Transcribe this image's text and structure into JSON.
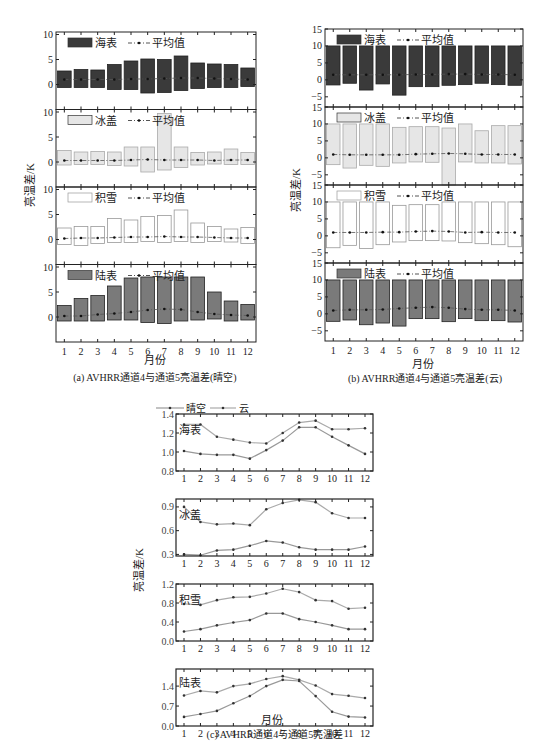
{
  "chart_data": [
    {
      "id": "a",
      "type": "bar",
      "title": "(a) AVHRR通道4与通道5亮温差(晴空)",
      "xlabel": "月份",
      "ylabel": "亮温差/K",
      "categories": [
        "1",
        "2",
        "3",
        "4",
        "5",
        "6",
        "7",
        "8",
        "9",
        "10",
        "11",
        "12"
      ],
      "ylim": [
        -5,
        10.5
      ],
      "yticks": [
        0,
        5,
        10
      ],
      "panels": [
        {
          "name": "海表",
          "legend": [
            "海表",
            "平均值"
          ],
          "fill": "#3a3a3a",
          "min": [
            -0.6,
            -0.6,
            -0.6,
            -1.0,
            -1.0,
            -1.7,
            -1.6,
            -1.2,
            -0.8,
            -0.6,
            -0.6,
            -0.4
          ],
          "max": [
            2.7,
            3.0,
            2.9,
            4.0,
            4.7,
            5.1,
            5.0,
            5.7,
            4.3,
            4.1,
            4.0,
            3.3
          ],
          "mean": [
            1.0,
            1.0,
            1.0,
            1.0,
            1.1,
            1.1,
            1.2,
            1.3,
            1.3,
            1.2,
            1.1,
            1.0
          ]
        },
        {
          "name": "冰盖",
          "legend": [
            "冰盖",
            "平均值"
          ],
          "fill": "#e6e6e6",
          "min": [
            -0.6,
            -0.5,
            -0.5,
            -0.7,
            -0.8,
            -2.0,
            -1.6,
            -1.1,
            -0.6,
            -0.4,
            -0.5,
            -0.5
          ],
          "max": [
            2.3,
            2.0,
            2.1,
            2.0,
            3.0,
            3.0,
            9.7,
            3.0,
            1.9,
            2.0,
            2.6,
            1.9
          ],
          "mean": [
            0.3,
            0.3,
            0.3,
            0.3,
            0.4,
            0.5,
            0.4,
            0.4,
            0.4,
            0.3,
            0.4,
            0.4
          ]
        },
        {
          "name": "积雪",
          "legend": [
            "积雪",
            "平均值"
          ],
          "fill": "#ffffff",
          "min": [
            -1.0,
            -1.2,
            -0.8,
            -0.6,
            -0.6,
            -0.4,
            -0.6,
            -0.4,
            -0.6,
            -0.4,
            -0.5,
            -0.8
          ],
          "max": [
            2.3,
            2.6,
            2.6,
            4.2,
            3.9,
            4.6,
            4.8,
            5.9,
            3.3,
            2.6,
            2.1,
            2.4
          ],
          "mean": [
            0.2,
            0.3,
            0.3,
            0.4,
            0.5,
            0.5,
            0.6,
            0.5,
            0.5,
            0.4,
            0.3,
            0.3
          ]
        },
        {
          "name": "陆表",
          "legend": [
            "陆表",
            "平均值"
          ],
          "fill": "#7a7a7a",
          "min": [
            -0.8,
            -0.8,
            -0.8,
            -0.6,
            -0.6,
            -1.1,
            -1.3,
            -0.8,
            -0.6,
            -0.4,
            -0.8,
            -0.6
          ],
          "max": [
            2.3,
            3.7,
            4.3,
            6.2,
            7.8,
            8.0,
            8.0,
            8.0,
            8.0,
            5.0,
            3.2,
            2.5
          ],
          "mean": [
            0.2,
            0.2,
            0.5,
            0.7,
            1.0,
            1.4,
            1.6,
            1.5,
            1.0,
            0.6,
            0.4,
            0.3
          ]
        }
      ]
    },
    {
      "id": "b",
      "type": "bar",
      "title": "(b) AVHRR通道4与通道5亮温差(云)",
      "xlabel": "月份",
      "ylabel": "亮温差/K",
      "categories": [
        "1",
        "2",
        "3",
        "4",
        "5",
        "6",
        "7",
        "8",
        "9",
        "10",
        "11",
        "12"
      ],
      "ylim": [
        -8,
        15
      ],
      "yticks": [
        -5,
        0,
        5,
        10,
        15
      ],
      "panels": [
        {
          "name": "海表",
          "legend": [
            "海表",
            "平均值"
          ],
          "fill": "#3a3a3a",
          "min": [
            -1.5,
            -1.0,
            -3.0,
            -1.2,
            -4.5,
            -2.0,
            -2.0,
            -1.6,
            -1.4,
            -1.0,
            -1.4,
            -1.6
          ],
          "max": [
            10,
            10,
            10,
            10,
            10,
            10,
            10,
            10,
            10,
            10,
            10,
            10
          ],
          "mean": [
            1.5,
            1.5,
            1.5,
            1.5,
            1.5,
            1.6,
            1.6,
            1.7,
            1.7,
            1.6,
            1.6,
            1.5
          ]
        },
        {
          "name": "冰盖",
          "legend": [
            "冰盖",
            "平均值"
          ],
          "fill": "#e6e6e6",
          "min": [
            -2.0,
            -3.0,
            -2.2,
            -2.5,
            -1.5,
            -1.2,
            -1.3,
            -15.0,
            -1.2,
            -1.5,
            -1.5,
            -1.8
          ],
          "max": [
            10,
            10,
            10,
            10,
            9.0,
            9.2,
            9.2,
            8.8,
            10,
            8.0,
            9.5,
            9.5
          ],
          "mean": [
            1.0,
            0.9,
            0.9,
            0.9,
            0.9,
            1.1,
            1.2,
            1.3,
            1.2,
            1.0,
            1.0,
            1.0
          ]
        },
        {
          "name": "积雪",
          "legend": [
            "积雪",
            "平均值"
          ],
          "fill": "#ffffff",
          "min": [
            -3.5,
            -2.8,
            -3.7,
            -2.6,
            -1.8,
            -1.4,
            -1.4,
            -1.5,
            -2.0,
            -2.3,
            -2.6,
            -3.2
          ],
          "max": [
            10,
            10,
            10,
            10,
            9.0,
            9.2,
            9.2,
            10,
            10,
            10,
            10,
            10
          ],
          "mean": [
            1.0,
            1.0,
            1.0,
            1.1,
            1.1,
            1.3,
            1.4,
            1.3,
            1.0,
            1.1,
            1.0,
            1.0
          ]
        },
        {
          "name": "陆表",
          "legend": [
            "陆表",
            "平均值"
          ],
          "fill": "#7a7a7a",
          "min": [
            -2.2,
            -1.8,
            -3.2,
            -2.7,
            -3.6,
            -1.4,
            -1.4,
            -2.3,
            -1.4,
            -2.0,
            -2.0,
            -2.4
          ],
          "max": [
            10,
            10,
            10,
            10,
            10,
            10,
            10,
            10,
            10,
            10,
            10,
            10
          ],
          "mean": [
            1.0,
            1.2,
            1.2,
            1.3,
            1.6,
            1.8,
            2.0,
            1.8,
            1.4,
            1.2,
            1.2,
            1.0
          ]
        }
      ]
    },
    {
      "id": "c",
      "type": "line",
      "title": "(c) AVHRR通道4与通道5亮温差",
      "xlabel": "月份",
      "ylabel": "亮温差/K",
      "x": [
        1,
        2,
        3,
        4,
        5,
        6,
        7,
        8,
        9,
        10,
        11,
        12
      ],
      "legend": [
        "晴空",
        "云"
      ],
      "panels": [
        {
          "name": "海表",
          "ylim": [
            0.8,
            1.4
          ],
          "yticks": [
            0.8,
            1.0,
            1.2,
            1.4
          ],
          "ytick_labels": [
            "0.8",
            "1.0",
            "1.2",
            "1.4"
          ],
          "series": [
            {
              "name": "晴空",
              "values": [
                1.01,
                0.98,
                0.97,
                0.97,
                0.93,
                1.02,
                1.12,
                1.26,
                1.26,
                1.16,
                1.07,
                0.98
              ]
            },
            {
              "name": "云",
              "values": [
                1.29,
                1.29,
                1.16,
                1.13,
                1.1,
                1.09,
                1.2,
                1.31,
                1.33,
                1.24,
                1.24,
                1.25
              ]
            }
          ]
        },
        {
          "name": "冰盖",
          "ylim": [
            0.28,
            1.0
          ],
          "yticks": [
            0.3,
            0.6,
            0.9
          ],
          "ytick_labels": [
            "0.3",
            "0.6",
            "0.9"
          ],
          "series": [
            {
              "name": "晴空",
              "values": [
                0.3,
                0.29,
                0.35,
                0.36,
                0.41,
                0.47,
                0.45,
                0.39,
                0.36,
                0.36,
                0.36,
                0.4
              ]
            },
            {
              "name": "云",
              "values": [
                0.9,
                0.71,
                0.68,
                0.69,
                0.67,
                0.87,
                0.95,
                0.99,
                0.96,
                0.82,
                0.76,
                0.76
              ]
            }
          ]
        },
        {
          "name": "积雪",
          "ylim": [
            0.0,
            1.2
          ],
          "yticks": [
            0.0,
            0.4,
            0.8,
            1.2
          ],
          "ytick_labels": [
            "0.0",
            "0.4",
            "0.8",
            "1.2"
          ],
          "series": [
            {
              "name": "晴空",
              "values": [
                0.2,
                0.25,
                0.33,
                0.39,
                0.44,
                0.58,
                0.58,
                0.46,
                0.4,
                0.33,
                0.25,
                0.25
              ]
            },
            {
              "name": "云",
              "values": [
                0.78,
                0.76,
                0.86,
                0.92,
                0.93,
                1.0,
                1.1,
                1.03,
                0.86,
                0.84,
                0.68,
                0.7
              ]
            }
          ]
        },
        {
          "name": "陆表",
          "ylim": [
            0.0,
            2.0
          ],
          "yticks": [
            0.0,
            0.7,
            1.4
          ],
          "ytick_labels": [
            "0.0",
            "0.7",
            "1.4"
          ],
          "series": [
            {
              "name": "晴空",
              "values": [
                0.32,
                0.42,
                0.53,
                0.8,
                1.05,
                1.4,
                1.62,
                1.58,
                1.05,
                0.5,
                0.33,
                0.3
              ]
            },
            {
              "name": "云",
              "values": [
                1.07,
                1.23,
                1.18,
                1.4,
                1.48,
                1.65,
                1.75,
                1.62,
                1.42,
                1.12,
                1.06,
                0.98
              ]
            }
          ]
        }
      ]
    }
  ],
  "labels": {
    "mean_label": "平均值",
    "xlabel": "月份",
    "ylabel": "亮温差/K",
    "caption_a": "(a) AVHRR通道4与通道5亮温差(晴空)",
    "caption_b": "(b) AVHRR通道4与通道5亮温差(云)",
    "caption_c": "(c) AVHRR通道4与通道5亮温差",
    "legend_clear": "晴空",
    "legend_cloud": "云"
  },
  "colors": {
    "axis": "#222222",
    "sea": "#3a3a3a",
    "ice": "#e6e6e6",
    "snow": "#ffffff",
    "land": "#7a7a7a",
    "line_clear": "#999999",
    "line_cloud": "#aaaaaa",
    "marker": "#222222"
  }
}
